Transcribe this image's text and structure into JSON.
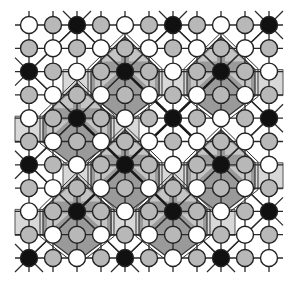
{
  "diagram": {
    "title": "",
    "width": 295,
    "height": 288,
    "grid": {
      "cols": 11,
      "rows": 11,
      "x0": 29,
      "dx": 24,
      "y0": 25,
      "dy": 23.3,
      "node_radius": 8.5,
      "node_types": [
        "WGBGWGBGWGB",
        "GWGWGWGWGWG",
        "BGWGBGWGBGW",
        "GWGWGWGWGWG",
        "WGBGWGBGWGB",
        "GWGWGWGWGWG",
        "BGWGBGWGBGW",
        "GWGWGWGWGWG",
        "WGBGWGBGWGB",
        "GWGWGWGWGWG",
        "BGWGBGWGBGW"
      ]
    },
    "node_colors": {
      "W": "#ffffff",
      "G": "#b8b8b8",
      "B": "#111111"
    },
    "region_colors": {
      "octagon_fill": "#9a9a9a",
      "octagon_inner": "#c4c4c4",
      "band_fill": "#d8d8d8"
    },
    "shaded_octagon_centers": [
      [
        4,
        2
      ],
      [
        8,
        2
      ],
      [
        2,
        4
      ],
      [
        4,
        6
      ],
      [
        8,
        6
      ],
      [
        2,
        8
      ],
      [
        6,
        8
      ]
    ],
    "thick_lines": [
      [
        [
          4,
          2
        ],
        [
          8,
          6
        ]
      ],
      [
        [
          8,
          2
        ],
        [
          2,
          8
        ]
      ],
      [
        [
          2,
          4
        ],
        [
          6,
          8
        ]
      ]
    ],
    "legend": {
      "white_node": "white site",
      "gray_node": "gray site",
      "black_node": "black site (octagon center)"
    }
  }
}
